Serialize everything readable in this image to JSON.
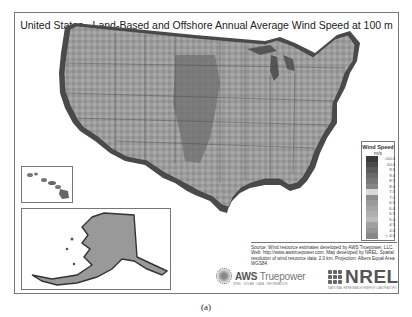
{
  "map": {
    "title": "United States - Land-Based and Offshore Annual Average Wind Speed at 100 m",
    "region": "Contiguous United States with Alaska and Hawaii insets",
    "color_scheme": "grayscale",
    "insets": [
      {
        "name": "Hawaii"
      },
      {
        "name": "Alaska"
      }
    ]
  },
  "legend": {
    "title": "Wind Speed",
    "unit": "m/s",
    "items": [
      {
        "label": ">10.0",
        "color": "#3a3a3a"
      },
      {
        "label": "10.0",
        "color": "#4a4a4a"
      },
      {
        "label": "9.5",
        "color": "#5a5a5a"
      },
      {
        "label": "9.0",
        "color": "#6a6a6a"
      },
      {
        "label": "8.5",
        "color": "#777777"
      },
      {
        "label": "8.0",
        "color": "#858585"
      },
      {
        "label": "7.5",
        "color": "#d9d9d9"
      },
      {
        "label": "7.0",
        "color": "#8e8e8e"
      },
      {
        "label": "6.5",
        "color": "#9a9a9a"
      },
      {
        "label": "6.0",
        "color": "#a5a5a5"
      },
      {
        "label": "5.5",
        "color": "#b0b0b0"
      },
      {
        "label": "5.0",
        "color": "#bcbcbc"
      },
      {
        "label": "4.5",
        "color": "#a0a0a0"
      },
      {
        "label": "4.0",
        "color": "#959595"
      },
      {
        "label": "< 4.0",
        "color": "#888888"
      }
    ]
  },
  "source": {
    "text": "Source: Wind resource estimates developed by AWS Truepower, LLC. Web: http://www.awstruepower.com. Map developed by NREL. Spatial resolution of wind resource data: 2.0 km. Projection: Albers Equal Area WGS84."
  },
  "logos": {
    "aws": {
      "name": "AWS",
      "name2": "Truepower",
      "tagline": "WIND · SOLAR · DATA · INFORMATION"
    },
    "nrel": {
      "name": "NREL",
      "tagline": "NATIONAL RENEWABLE ENERGY LABORATORY"
    }
  },
  "caption": "(a)"
}
